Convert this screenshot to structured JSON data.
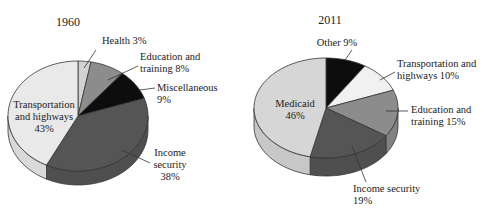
{
  "figure_title_partial": "",
  "chart_data": [
    {
      "type": "pie",
      "title": "1960",
      "style": "3d-extruded",
      "start_angle_deg": 0,
      "direction": "clockwise",
      "slices": [
        {
          "name": "Health",
          "value": 3,
          "label": [
            "Health 3%"
          ],
          "color": "#d2d2d2"
        },
        {
          "name": "Education and training",
          "value": 8,
          "label": [
            "Education and",
            "training 8%"
          ],
          "color": "#8c8c8c"
        },
        {
          "name": "Miscellaneous",
          "value": 9,
          "label": [
            "Miscellaneous",
            "9%"
          ],
          "color": "#0d0d0d"
        },
        {
          "name": "Income security",
          "value": 38,
          "label": [
            "Income",
            "security",
            "38%"
          ],
          "color": "#555555"
        },
        {
          "name": "Transportation and highways",
          "value": 43,
          "label": [
            "Transportation",
            "and highways",
            "43%"
          ],
          "color": "#e9e9e9"
        }
      ]
    },
    {
      "type": "pie",
      "title": "2011",
      "style": "3d-extruded",
      "start_angle_deg": 0,
      "direction": "clockwise",
      "slices": [
        {
          "name": "Other",
          "value": 9,
          "label": [
            "Other 9%"
          ],
          "color": "#0d0d0d"
        },
        {
          "name": "Transportation and highways",
          "value": 10,
          "label": [
            "Transportation and",
            "highways 10%"
          ],
          "color": "#f1f1f1"
        },
        {
          "name": "Education and training",
          "value": 15,
          "label": [
            "Education and",
            "training 15%"
          ],
          "color": "#8c8c8c"
        },
        {
          "name": "Income security",
          "value": 19,
          "label": [
            "Income security",
            "19%"
          ],
          "color": "#555555"
        },
        {
          "name": "Medicaid",
          "value": 46,
          "label": [
            "Medicaid",
            "46%"
          ],
          "color": "#d6d6d6"
        }
      ]
    }
  ],
  "layout": {
    "pies": [
      {
        "cx": 78,
        "cy": 116,
        "rx": 70,
        "ry": 55,
        "depth": 14,
        "title_pos": [
          68,
          26
        ],
        "labels": [
          {
            "x": 102,
            "y": 44,
            "anchor": "start",
            "line": [
              [
                96,
                50
              ],
              [
                84,
                68
              ]
            ]
          },
          {
            "x": 140,
            "y": 60,
            "anchor": "start",
            "line": [
              [
                138,
                66
              ],
              [
                108,
                80
              ]
            ]
          },
          {
            "x": 157,
            "y": 91,
            "anchor": "start",
            "line": [
              [
                155,
                88
              ],
              [
                140,
                90
              ]
            ]
          },
          {
            "x": 170,
            "y": 156,
            "anchor": "middle",
            "line": [
              [
                150,
                163
              ],
              [
                122,
                150
              ]
            ]
          },
          {
            "x": 44,
            "y": 108,
            "anchor": "middle",
            "inside": true
          }
        ]
      },
      {
        "cx": 326,
        "cy": 108,
        "rx": 72,
        "ry": 50,
        "depth": 18,
        "title_pos": [
          330,
          24
        ],
        "labels": [
          {
            "x": 337,
            "y": 46,
            "anchor": "middle",
            "line": [
              [
                352,
                50
              ],
              [
                345,
                60
              ]
            ]
          },
          {
            "x": 397,
            "y": 67,
            "anchor": "start",
            "line": [
              [
                395,
                72
              ],
              [
                380,
                80
              ]
            ]
          },
          {
            "x": 411,
            "y": 113,
            "anchor": "start",
            "line": [
              [
                408,
                111
              ],
              [
                386,
                111
              ]
            ]
          },
          {
            "x": 353,
            "y": 192,
            "anchor": "start",
            "line": [
              [
                366,
                182
              ],
              [
                352,
                146
              ]
            ]
          },
          {
            "x": 295,
            "y": 107,
            "anchor": "middle",
            "inside": true
          }
        ]
      }
    ]
  }
}
